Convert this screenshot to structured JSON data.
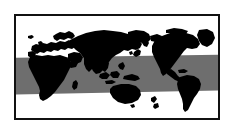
{
  "figure": {
    "title": "World map with tropical belt band",
    "caption": "",
    "projection": "pacific-centered world map",
    "background_color": "#ffffff"
  },
  "frame": {
    "border_color": "#111111",
    "border_width_px": 2,
    "x": 14,
    "y": 14,
    "width": 206,
    "height": 106,
    "fill_color": "#ffffff"
  },
  "map": {
    "ocean_color": "#ffffff",
    "land_color": "#000000",
    "band_color": "#6e6e6e",
    "land_label": "landmasses",
    "ocean_label": "oceans",
    "band_label": "tropical belt band"
  },
  "band": {
    "name": "tropical-belt",
    "color": "#6e6e6e",
    "left_top_pct": 41.0,
    "left_bottom_pct": 77.0,
    "right_top_pct": 38.0,
    "right_bottom_pct": 73.0,
    "description": "shaded horizontal belt spanning full map width, sloping slightly upward toward the right"
  },
  "continents": [
    {
      "id": "africa",
      "label": "Africa"
    },
    {
      "id": "europe",
      "label": "Europe"
    },
    {
      "id": "asia",
      "label": "Asia"
    },
    {
      "id": "australia",
      "label": "Australia"
    },
    {
      "id": "new-zealand",
      "label": "New Zealand"
    },
    {
      "id": "north-america",
      "label": "North America"
    },
    {
      "id": "south-america",
      "label": "South America"
    },
    {
      "id": "greenland",
      "label": "Greenland"
    },
    {
      "id": "madagascar",
      "label": "Madagascar"
    },
    {
      "id": "japan",
      "label": "Japan"
    },
    {
      "id": "indonesia",
      "label": "Indonesia"
    },
    {
      "id": "united-kingdom",
      "label": "United Kingdom"
    }
  ]
}
